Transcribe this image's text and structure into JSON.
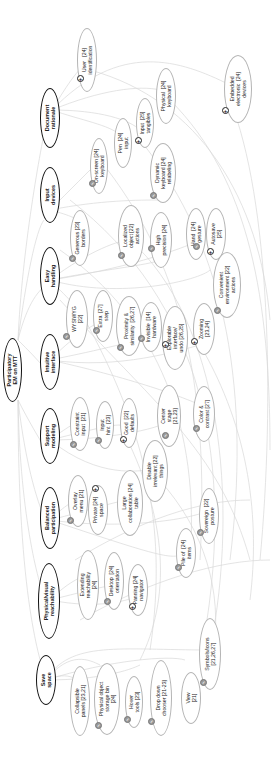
{
  "root": {
    "label": "Participatory\nEM on MTT"
  },
  "categories": [
    {
      "id": "document-rationale",
      "label": "Document\nrationale"
    },
    {
      "id": "input-devices",
      "label": "Input\ndevices"
    },
    {
      "id": "easy-handling",
      "label": "Easy\nhandling"
    },
    {
      "id": "intuitive-interface",
      "label": "Intuitive\ninterface"
    },
    {
      "id": "support-modeling",
      "label": "Support\nmodeling"
    },
    {
      "id": "balanced-participation",
      "label": "Balanced\nparticipation"
    },
    {
      "id": "physical-visual-reachability",
      "label": "Physical/visual\nreachability"
    },
    {
      "id": "save-space",
      "label": "Save\nspace"
    }
  ],
  "leaves": [
    {
      "label": "User   [24]\nidentification",
      "badge": "plus"
    },
    {
      "label": "Embedded\nelectronic  [24]\ndevices",
      "badge": "plus"
    },
    {
      "label": "Physical  [24]\nkeyboard",
      "badge": ""
    },
    {
      "label": "Input  [25]\ntangibles",
      "badge": "plus"
    },
    {
      "label": "Pen  [24]\ninput",
      "badge": ""
    },
    {
      "label": "On-screen [24]\nkeyboard",
      "badge": "check"
    },
    {
      "label": "Dynamic\nkeyboard [24]\nrelabeling",
      "badge": "check"
    },
    {
      "label": "Generous [23]\nborders",
      "badge": "check"
    },
    {
      "label": "Localized\nobject [22]\nactions",
      "badge": "check"
    },
    {
      "label": "High\nprecision [24]",
      "badge": "check"
    },
    {
      "label": "Hand  [24]\ngesture",
      "badge": "check"
    },
    {
      "label": "Autosave\n[25]",
      "badge": "plus"
    },
    {
      "label": "Convenient\nenvironment [22]\nactions",
      "badge": "check"
    },
    {
      "label": "WYSIWYG\n[22]",
      "badge": "check"
    },
    {
      "label": "Extra  [27]\nstep",
      "badge": "check"
    },
    {
      "label": "Proximity &\nsimilarity  [26,27]",
      "badge": "check"
    },
    {
      "label": "Invisible  [14]\nhardware",
      "badge": "check"
    },
    {
      "label": "Explorable\ninterface/\nundo [26,25]",
      "badge": "plus"
    },
    {
      "label": "Zooming\n[23,24]",
      "badge": "plus"
    },
    {
      "label": "Constraint\ninput  [21]",
      "badge": "check"
    },
    {
      "label": "Input\nhint  [23]",
      "badge": "check"
    },
    {
      "label": "Good  [22]\ndefaults",
      "badge": "plus"
    },
    {
      "label": "Center\nstage\n[21,23]",
      "badge": "check"
    },
    {
      "label": "Color &\ncontrast [27]",
      "badge": "check"
    },
    {
      "label": "Disable\nirrelevant [22]\nthings",
      "badge": ""
    },
    {
      "label": "Overlay\nmenu [21]",
      "badge": "check"
    },
    {
      "label": "Private [24]\nspace",
      "badge": "plus"
    },
    {
      "label": "Large\ncollaboration [24]\ntable",
      "badge": ""
    },
    {
      "label": "Sovereign  [22]\nposture",
      "badge": "check"
    },
    {
      "label": "Pile of  [24]\nitems",
      "badge": "check"
    },
    {
      "label": "Extending\nreachability\n[24]",
      "badge": ""
    },
    {
      "label": "Desktop  [24]\norientation",
      "badge": "check"
    },
    {
      "label": "Panning [24]\nnavigator",
      "badge": "plus"
    },
    {
      "label": "Symbols/icons\n[21,26,27]",
      "badge": "check"
    },
    {
      "label": "Collapsible\npanels [23,21]",
      "badge": ""
    },
    {
      "label": "Physical object\nstorage bin\n[24]",
      "badge": "check"
    },
    {
      "label": "Hover\ntools [23]",
      "badge": "check"
    },
    {
      "label": "Drop down\nchooser [21-23]",
      "badge": "check"
    },
    {
      "label": "View\n[21]",
      "badge": ""
    }
  ],
  "legend": {
    "check_icon": "check-badge-icon",
    "plus_icon": "plus-badge-icon"
  },
  "colors": {
    "node_border": "#b4b4b4",
    "category_border": "#111111",
    "link": "#d6d6d6",
    "check_badge": "#9a9a9a"
  }
}
